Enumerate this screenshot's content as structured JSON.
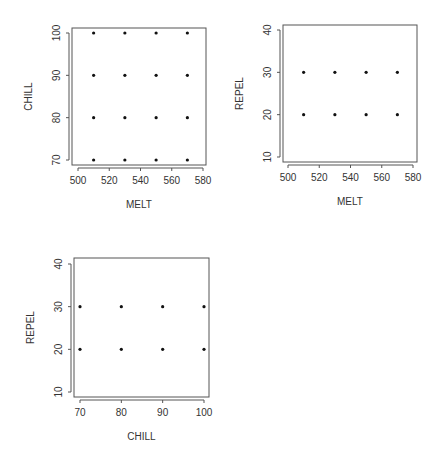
{
  "chart_data": [
    {
      "type": "scatter",
      "title": "",
      "xlabel": "MELT",
      "ylabel": "CHILL",
      "xlim": [
        500,
        580
      ],
      "ylim": [
        70,
        100
      ],
      "xticks": [
        500,
        520,
        540,
        560,
        580
      ],
      "yticks": [
        70,
        80,
        90,
        100
      ],
      "grid": false,
      "points": [
        {
          "x": 510,
          "y": 70
        },
        {
          "x": 530,
          "y": 70
        },
        {
          "x": 550,
          "y": 70
        },
        {
          "x": 570,
          "y": 70
        },
        {
          "x": 510,
          "y": 80
        },
        {
          "x": 530,
          "y": 80
        },
        {
          "x": 550,
          "y": 80
        },
        {
          "x": 570,
          "y": 80
        },
        {
          "x": 510,
          "y": 90
        },
        {
          "x": 530,
          "y": 90
        },
        {
          "x": 550,
          "y": 90
        },
        {
          "x": 570,
          "y": 90
        },
        {
          "x": 510,
          "y": 100
        },
        {
          "x": 530,
          "y": 100
        },
        {
          "x": 550,
          "y": 100
        },
        {
          "x": 570,
          "y": 100
        }
      ]
    },
    {
      "type": "scatter",
      "title": "",
      "xlabel": "MELT",
      "ylabel": "REPEL",
      "xlim": [
        500,
        580
      ],
      "ylim": [
        10,
        40
      ],
      "xticks": [
        500,
        520,
        540,
        560,
        580
      ],
      "yticks": [
        10,
        20,
        30,
        40
      ],
      "grid": false,
      "points": [
        {
          "x": 510,
          "y": 20
        },
        {
          "x": 530,
          "y": 20
        },
        {
          "x": 550,
          "y": 20
        },
        {
          "x": 570,
          "y": 20
        },
        {
          "x": 510,
          "y": 30
        },
        {
          "x": 530,
          "y": 30
        },
        {
          "x": 550,
          "y": 30
        },
        {
          "x": 570,
          "y": 30
        }
      ]
    },
    {
      "type": "scatter",
      "title": "",
      "xlabel": "CHILL",
      "ylabel": "REPEL",
      "xlim": [
        70,
        100
      ],
      "ylim": [
        10,
        40
      ],
      "xticks": [
        70,
        80,
        90,
        100
      ],
      "yticks": [
        10,
        20,
        30,
        40
      ],
      "grid": false,
      "points": [
        {
          "x": 70,
          "y": 20
        },
        {
          "x": 80,
          "y": 20
        },
        {
          "x": 90,
          "y": 20
        },
        {
          "x": 100,
          "y": 20
        },
        {
          "x": 70,
          "y": 30
        },
        {
          "x": 80,
          "y": 30
        },
        {
          "x": 90,
          "y": 30
        },
        {
          "x": 100,
          "y": 30
        }
      ]
    }
  ],
  "layout": [
    {
      "box": [
        72,
        28,
        206,
        165
      ],
      "xpx": [
        78,
        203
      ],
      "ypx": [
        160,
        33
      ]
    },
    {
      "box": [
        283,
        25,
        417,
        162
      ],
      "xpx": [
        288,
        413
      ],
      "ypx": [
        157,
        30
      ]
    },
    {
      "box": [
        74,
        258,
        209,
        397
      ],
      "xpx": [
        80,
        204
      ],
      "ypx": [
        392,
        264
      ]
    }
  ]
}
